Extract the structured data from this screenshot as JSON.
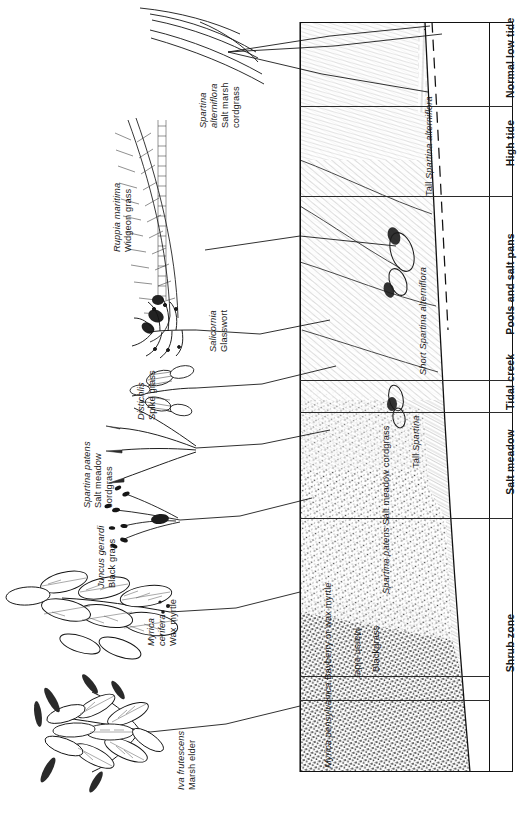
{
  "figure": {
    "kind": "salt-marsh-zonation-profile",
    "orientation": "rotated-90-ccw",
    "style": "pen-and-ink line drawing"
  },
  "plant_labels": [
    {
      "id": "spartina-alterniflora",
      "scientific": "Spartina\nalterniflora",
      "line1": "Spartina",
      "line2": "alterniflora",
      "common": "Salt marsh cordgrass",
      "common_line1": "Salt marsh",
      "common_line2": "cordgrass"
    },
    {
      "id": "ruppia-maritima",
      "line1": "Ruppia maritima",
      "line2": "",
      "common_line1": "Widgeon grass",
      "common_line2": ""
    },
    {
      "id": "salicornia",
      "line1": "Salicornia",
      "line2": "",
      "common_line1": "Glasswort",
      "common_line2": ""
    },
    {
      "id": "distichlis",
      "line1": "Distichlis",
      "line2": "",
      "common_line1": "Spike grass",
      "common_line2": ""
    },
    {
      "id": "spartina-patens",
      "line1": "Spartina patens",
      "line2": "",
      "common_line1": "Salt meadow",
      "common_line2": "cordgrass"
    },
    {
      "id": "juncus-gerardi",
      "line1": "Juncus gerardi",
      "line2": "",
      "common_line1": "Black grass",
      "common_line2": ""
    },
    {
      "id": "myrica-cerifera",
      "line1": "Myrica",
      "line2": "cerifera",
      "common_line1": "Wax myrtle",
      "common_line2": ""
    },
    {
      "id": "iva-frutescens",
      "line1": "Iva frutescens",
      "line2": "",
      "common_line1": "Marsh elder",
      "common_line2": ""
    }
  ],
  "inner_column": {
    "title": "vegetation-zone-names",
    "entries": [
      {
        "id": "tall-spartina-alterniflora",
        "line1": "Tall",
        "line2": "Spartina",
        "line3": "alterniflora",
        "italic_lines": [
          2,
          3
        ]
      },
      {
        "id": "short-spartina-alterniflora",
        "line1": "Short Spartina",
        "line2": "alterniflora",
        "line3": "",
        "italic_lines": [
          1,
          2
        ]
      },
      {
        "id": "tall-spartina",
        "line1": "Tall",
        "line2": "Spartina",
        "line3": "",
        "italic_lines": [
          2
        ]
      },
      {
        "id": "spartina-patens-zone",
        "line1": "Spartina patens",
        "line2": "Salt meadow",
        "line3": "cordgrass",
        "italic_lines": [
          1
        ]
      },
      {
        "id": "blackgrass",
        "line1": "Blackgrass",
        "line2": "",
        "line3": "",
        "italic_lines": []
      },
      {
        "id": "marsh-elder",
        "line1": "Marsh elder",
        "line2": "",
        "line3": "",
        "italic_lines": []
      },
      {
        "id": "myrica-pensylvanica",
        "line1": "Myrica",
        "line2": "pensylvanica",
        "line3": "Bayberry or",
        "line4": "wax myrtle",
        "italic_lines": [
          1,
          2
        ]
      }
    ]
  },
  "zone_column": {
    "title": "tidal-zone-names",
    "entries": [
      {
        "id": "normal-low-tide",
        "line1": "Normal",
        "line2": "low tide"
      },
      {
        "id": "high-tide",
        "line1": "High tide",
        "line2": ""
      },
      {
        "id": "pools-and-salt-pans",
        "line1": "Pools and salt pans",
        "line2": ""
      },
      {
        "id": "tidal-creek",
        "line1": "Tidal",
        "line2": "creek"
      },
      {
        "id": "salt-meadow",
        "line1": "Salt meadow",
        "line2": ""
      },
      {
        "id": "shrub-zone",
        "line1": "Shrub zone",
        "line2": ""
      }
    ]
  },
  "colors": {
    "ink": "#1a1a1a",
    "rule": "#2b2b2b",
    "paper": "#ffffff",
    "hatch": "#4a4a4a"
  }
}
